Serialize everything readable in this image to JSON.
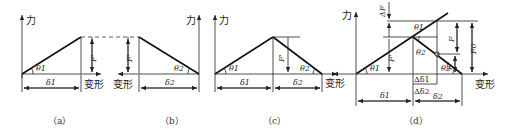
{
  "figure": {
    "axis_labels": {
      "force": "力",
      "deformation": "变形"
    },
    "panels": [
      {
        "id": "a",
        "caption": "（a）",
        "angle": "θ1",
        "delta": "δ1",
        "force": "F'"
      },
      {
        "id": "b",
        "caption": "（b）",
        "angle": "θ2",
        "delta": "δ2",
        "force": "F'"
      },
      {
        "id": "c",
        "caption": "（c）",
        "angles": [
          "θ1",
          "θ2"
        ],
        "deltas": [
          "δ1",
          "δ2"
        ],
        "force": "F'"
      },
      {
        "id": "d",
        "caption": "（d）",
        "angles": [
          "θ1",
          "θ2",
          "θ1",
          "θ2"
        ],
        "deltas": [
          "δ1",
          "δ2",
          "Δδ1",
          "Δδ2"
        ],
        "forces": [
          "ΔF",
          "F'",
          "F",
          "F0",
          "F''"
        ]
      }
    ]
  }
}
